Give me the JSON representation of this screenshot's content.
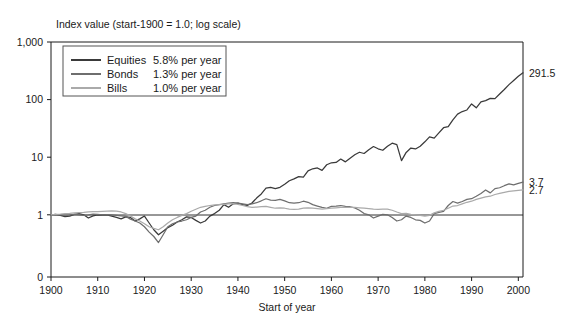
{
  "chart_data": {
    "type": "line",
    "title": "Index value (start-1900 = 1.0; log scale)",
    "xlabel": "Start of year",
    "ylabel": "",
    "scale": "log",
    "grid": false,
    "legend_position": "top-left",
    "xlim": [
      1900,
      2001
    ],
    "ylim": [
      0.25,
      1000
    ],
    "x_ticks": [
      "1900",
      "1910",
      "1920",
      "1930",
      "1940",
      "1950",
      "1960",
      "1970",
      "1980",
      "1990",
      "2000"
    ],
    "y_ticks": [
      "1,000",
      "100",
      "10",
      "1",
      "0"
    ],
    "y_tick_values": [
      1000,
      100,
      10,
      1,
      0
    ],
    "end_labels": [
      {
        "series": "Equities",
        "value": "291.5"
      },
      {
        "series": "Bonds",
        "value": "3.7"
      },
      {
        "series": "Bills",
        "value": "2.7"
      }
    ],
    "series": [
      {
        "name": "Equities",
        "annual_return": "5.8% per year",
        "color": "#3a3a3a",
        "x": [
          1900,
          1901,
          1902,
          1903,
          1904,
          1905,
          1906,
          1907,
          1908,
          1909,
          1910,
          1911,
          1912,
          1913,
          1914,
          1915,
          1916,
          1917,
          1918,
          1919,
          1920,
          1921,
          1922,
          1923,
          1924,
          1925,
          1926,
          1927,
          1928,
          1929,
          1930,
          1931,
          1932,
          1933,
          1934,
          1935,
          1936,
          1937,
          1938,
          1939,
          1940,
          1941,
          1942,
          1943,
          1944,
          1945,
          1946,
          1947,
          1948,
          1949,
          1950,
          1951,
          1952,
          1953,
          1954,
          1955,
          1956,
          1957,
          1958,
          1959,
          1960,
          1961,
          1962,
          1963,
          1964,
          1965,
          1966,
          1967,
          1968,
          1969,
          1970,
          1971,
          1972,
          1973,
          1974,
          1975,
          1976,
          1977,
          1978,
          1979,
          1980,
          1981,
          1982,
          1983,
          1984,
          1985,
          1986,
          1987,
          1988,
          1989,
          1990,
          1991,
          1992,
          1993,
          1994,
          1995,
          1996,
          1997,
          1998,
          1999,
          2000,
          2001
        ],
        "values": [
          1.0,
          1.02,
          0.98,
          0.93,
          0.95,
          1.02,
          1.05,
          1.0,
          0.88,
          0.96,
          1.0,
          0.99,
          1.0,
          0.95,
          0.9,
          0.85,
          0.92,
          0.9,
          0.78,
          0.85,
          0.95,
          0.72,
          0.55,
          0.45,
          0.52,
          0.6,
          0.66,
          0.75,
          0.82,
          0.92,
          0.9,
          0.8,
          0.72,
          0.78,
          0.95,
          1.05,
          1.2,
          1.5,
          1.35,
          1.55,
          1.6,
          1.5,
          1.45,
          1.6,
          1.95,
          2.3,
          2.9,
          3.0,
          2.85,
          3.0,
          3.4,
          3.9,
          4.2,
          4.6,
          4.5,
          5.8,
          6.3,
          6.5,
          5.9,
          7.4,
          8.0,
          8.1,
          9.3,
          8.3,
          9.6,
          11.0,
          12.2,
          11.6,
          13.5,
          15.3,
          14.0,
          13.2,
          15.5,
          17.5,
          16.5,
          8.7,
          12.1,
          14.4,
          13.9,
          15.5,
          18.5,
          22.5,
          21.4,
          26.5,
          32.5,
          34.0,
          44.5,
          56.0,
          62.0,
          66.0,
          84.0,
          72.0,
          91.0,
          96.0,
          105.0,
          104.0,
          125.0,
          150.0,
          182.0,
          215.0,
          255.0,
          291.5
        ]
      },
      {
        "name": "Bonds",
        "annual_return": "1.3% per year",
        "color": "#6e6e6e",
        "x": [
          1900,
          1901,
          1902,
          1903,
          1904,
          1905,
          1906,
          1907,
          1908,
          1909,
          1910,
          1911,
          1912,
          1913,
          1914,
          1915,
          1916,
          1917,
          1918,
          1919,
          1920,
          1921,
          1922,
          1923,
          1924,
          1925,
          1926,
          1927,
          1928,
          1929,
          1930,
          1931,
          1932,
          1933,
          1934,
          1935,
          1936,
          1937,
          1938,
          1939,
          1940,
          1941,
          1942,
          1943,
          1944,
          1945,
          1946,
          1947,
          1948,
          1949,
          1950,
          1951,
          1952,
          1953,
          1954,
          1955,
          1956,
          1957,
          1958,
          1959,
          1960,
          1961,
          1962,
          1963,
          1964,
          1965,
          1966,
          1967,
          1968,
          1969,
          1970,
          1971,
          1972,
          1973,
          1974,
          1975,
          1976,
          1977,
          1978,
          1979,
          1980,
          1981,
          1982,
          1983,
          1984,
          1985,
          1986,
          1987,
          1988,
          1989,
          1990,
          1991,
          1992,
          1993,
          1994,
          1995,
          1996,
          1997,
          1998,
          1999,
          2000,
          2001
        ],
        "values": [
          1.0,
          1.0,
          1.01,
          0.99,
          1.0,
          1.02,
          1.0,
          0.98,
          1.0,
          1.03,
          1.02,
          1.0,
          1.01,
          1.0,
          0.98,
          0.96,
          0.94,
          0.84,
          0.78,
          0.72,
          0.62,
          0.5,
          0.42,
          0.33,
          0.45,
          0.62,
          0.7,
          0.75,
          0.78,
          0.82,
          0.9,
          0.95,
          1.12,
          1.2,
          1.35,
          1.45,
          1.5,
          1.55,
          1.6,
          1.62,
          1.6,
          1.55,
          1.5,
          1.55,
          1.62,
          1.75,
          1.9,
          1.8,
          1.78,
          1.85,
          1.75,
          1.62,
          1.6,
          1.62,
          1.72,
          1.65,
          1.5,
          1.42,
          1.35,
          1.3,
          1.4,
          1.42,
          1.45,
          1.4,
          1.38,
          1.32,
          1.2,
          1.05,
          1.0,
          0.88,
          0.95,
          1.02,
          1.0,
          0.9,
          0.78,
          0.82,
          0.95,
          0.9,
          0.82,
          0.8,
          0.72,
          0.78,
          1.05,
          1.1,
          1.15,
          1.45,
          1.7,
          1.6,
          1.7,
          1.85,
          1.9,
          2.1,
          2.35,
          2.7,
          2.4,
          2.85,
          2.95,
          3.2,
          3.45,
          3.3,
          3.5,
          3.7
        ]
      },
      {
        "name": "Bills",
        "annual_return": "1.0% per year",
        "color": "#aaaaaa",
        "x": [
          1900,
          1901,
          1902,
          1903,
          1904,
          1905,
          1906,
          1907,
          1908,
          1909,
          1910,
          1911,
          1912,
          1913,
          1914,
          1915,
          1916,
          1917,
          1918,
          1919,
          1920,
          1921,
          1922,
          1923,
          1924,
          1925,
          1926,
          1927,
          1928,
          1929,
          1930,
          1931,
          1932,
          1933,
          1934,
          1935,
          1936,
          1937,
          1938,
          1939,
          1940,
          1941,
          1942,
          1943,
          1944,
          1945,
          1946,
          1947,
          1948,
          1949,
          1950,
          1951,
          1952,
          1953,
          1954,
          1955,
          1956,
          1957,
          1958,
          1959,
          1960,
          1961,
          1962,
          1963,
          1964,
          1965,
          1966,
          1967,
          1968,
          1969,
          1970,
          1971,
          1972,
          1973,
          1974,
          1975,
          1976,
          1977,
          1978,
          1979,
          1980,
          1981,
          1982,
          1983,
          1984,
          1985,
          1986,
          1987,
          1988,
          1989,
          1990,
          1991,
          1992,
          1993,
          1994,
          1995,
          1996,
          1997,
          1998,
          1999,
          2000,
          2001
        ],
        "values": [
          1.0,
          1.02,
          1.03,
          1.05,
          1.06,
          1.08,
          1.09,
          1.1,
          1.12,
          1.13,
          1.14,
          1.15,
          1.16,
          1.17,
          1.16,
          1.12,
          1.05,
          0.95,
          0.85,
          0.78,
          0.7,
          0.62,
          0.58,
          0.55,
          0.62,
          0.72,
          0.82,
          0.9,
          0.98,
          1.05,
          1.15,
          1.25,
          1.35,
          1.4,
          1.45,
          1.48,
          1.5,
          1.52,
          1.55,
          1.56,
          1.52,
          1.45,
          1.38,
          1.35,
          1.36,
          1.38,
          1.4,
          1.35,
          1.3,
          1.32,
          1.3,
          1.25,
          1.24,
          1.26,
          1.3,
          1.32,
          1.3,
          1.28,
          1.26,
          1.28,
          1.3,
          1.32,
          1.34,
          1.34,
          1.35,
          1.34,
          1.32,
          1.3,
          1.28,
          1.25,
          1.24,
          1.26,
          1.25,
          1.2,
          1.12,
          1.05,
          1.06,
          1.02,
          1.0,
          0.98,
          0.95,
          0.98,
          1.08,
          1.15,
          1.2,
          1.3,
          1.42,
          1.45,
          1.55,
          1.65,
          1.72,
          1.85,
          1.95,
          2.05,
          2.1,
          2.25,
          2.35,
          2.45,
          2.55,
          2.6,
          2.65,
          2.7
        ]
      }
    ]
  }
}
